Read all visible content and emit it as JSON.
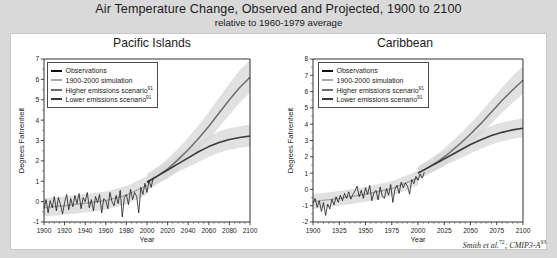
{
  "figure": {
    "title": "Air Temperature Change, Observed and Projected, 1900 to 2100",
    "subtitle": "relative to 1960-1979 average",
    "citation_text": "Smith et al.",
    "citation_sup1": "72",
    "citation_mid": "; CMIP3-A",
    "citation_sup2": "93",
    "background_color": "#d9d9d9",
    "panel_color": "#ffffff"
  },
  "legend": {
    "position": "upper-left-inside",
    "entries": [
      {
        "label": "Observations",
        "color": "#111111",
        "sup": ""
      },
      {
        "label": "1900-2000 simulation",
        "color": "#a8a8a8",
        "sup": ""
      },
      {
        "label": "Higher emissions scenario",
        "color": "#6d6d6d",
        "sup": "91"
      },
      {
        "label": "Lower emissions scenario",
        "color": "#3a3a3a",
        "sup": "91"
      }
    ]
  },
  "chart_data": [
    {
      "type": "line",
      "title": "Pacific Islands",
      "xlabel": "Year",
      "ylabel": "Degrees Fahrenheit",
      "xlim": [
        1900,
        2100
      ],
      "ylim": [
        -1,
        7
      ],
      "xticks": [
        1900,
        1920,
        1940,
        1960,
        1980,
        2000,
        2020,
        2040,
        2060,
        2080,
        2100
      ],
      "yticks": [
        -1,
        0,
        1,
        2,
        3,
        4,
        5,
        6,
        7
      ],
      "grid": false,
      "series": [
        {
          "name": "Observations",
          "color": "#111111",
          "x": [
            1900,
            1902,
            1904,
            1906,
            1908,
            1910,
            1912,
            1914,
            1916,
            1918,
            1920,
            1922,
            1924,
            1926,
            1928,
            1930,
            1932,
            1934,
            1936,
            1938,
            1940,
            1942,
            1944,
            1946,
            1948,
            1950,
            1952,
            1954,
            1956,
            1958,
            1960,
            1962,
            1964,
            1966,
            1968,
            1970,
            1972,
            1974,
            1976,
            1978,
            1980,
            1982,
            1984,
            1986,
            1988,
            1990,
            1992,
            1994,
            1996,
            1998,
            2000,
            2002,
            2004,
            2006
          ],
          "values": [
            -0.35,
            0.1,
            -0.55,
            0.05,
            -0.3,
            0.25,
            -0.45,
            0.2,
            -0.15,
            -0.6,
            -0.05,
            0.35,
            -0.4,
            0.15,
            -0.25,
            0.3,
            -0.1,
            0.4,
            -0.35,
            0.2,
            0.0,
            0.45,
            -0.3,
            0.1,
            -0.45,
            0.25,
            -0.05,
            0.35,
            -0.55,
            0.15,
            0.05,
            -0.35,
            0.45,
            0.0,
            -0.2,
            0.3,
            -0.1,
            0.55,
            -0.75,
            0.2,
            0.35,
            -0.15,
            0.6,
            0.1,
            0.45,
            0.25,
            -0.55,
            0.7,
            0.35,
            0.9,
            0.45,
            1.05,
            0.7,
            1.15
          ]
        },
        {
          "name": "1900-2000 simulation",
          "color": "#a8a8a8",
          "x": [
            1900,
            1920,
            1940,
            1960,
            1980,
            2000
          ],
          "values": [
            -0.28,
            -0.2,
            -0.08,
            0.05,
            0.32,
            0.8
          ]
        },
        {
          "name": "Higher emissions scenario",
          "color": "#6d6d6d",
          "x": [
            2000,
            2010,
            2020,
            2030,
            2040,
            2050,
            2060,
            2070,
            2080,
            2090,
            2100
          ],
          "values": [
            0.95,
            1.25,
            1.6,
            2.05,
            2.55,
            3.1,
            3.7,
            4.35,
            5.0,
            5.6,
            6.1
          ],
          "band_low": [
            0.55,
            0.85,
            1.15,
            1.55,
            2.0,
            2.5,
            3.05,
            3.65,
            4.25,
            4.85,
            5.35
          ],
          "band_high": [
            1.35,
            1.7,
            2.1,
            2.6,
            3.15,
            3.75,
            4.4,
            5.1,
            5.8,
            6.45,
            6.95
          ]
        },
        {
          "name": "Lower emissions scenario",
          "color": "#3a3a3a",
          "x": [
            2000,
            2010,
            2020,
            2030,
            2040,
            2050,
            2060,
            2070,
            2080,
            2090,
            2100
          ],
          "values": [
            0.95,
            1.25,
            1.55,
            1.85,
            2.15,
            2.45,
            2.7,
            2.9,
            3.05,
            3.15,
            3.22
          ],
          "band_low": [
            0.6,
            0.9,
            1.15,
            1.45,
            1.7,
            1.95,
            2.2,
            2.4,
            2.55,
            2.65,
            2.7
          ],
          "band_high": [
            1.3,
            1.6,
            1.95,
            2.25,
            2.6,
            2.9,
            3.2,
            3.45,
            3.6,
            3.7,
            3.78
          ]
        }
      ]
    },
    {
      "type": "line",
      "title": "Caribbean",
      "xlabel": "Year",
      "ylabel": "Degrees Fahrenheit",
      "xlim": [
        1900,
        2100
      ],
      "ylim": [
        -2,
        8
      ],
      "xticks": [
        1900,
        1925,
        1950,
        1975,
        2000,
        2025,
        2050,
        2075,
        2100
      ],
      "yticks": [
        -2,
        -1,
        0,
        1,
        2,
        3,
        4,
        5,
        6,
        7,
        8
      ],
      "grid": false,
      "series": [
        {
          "name": "Observations",
          "color": "#111111",
          "x": [
            1900,
            1902,
            1904,
            1906,
            1908,
            1910,
            1912,
            1914,
            1916,
            1918,
            1920,
            1922,
            1924,
            1926,
            1928,
            1930,
            1932,
            1934,
            1936,
            1938,
            1940,
            1942,
            1944,
            1946,
            1948,
            1950,
            1952,
            1954,
            1956,
            1958,
            1960,
            1962,
            1964,
            1966,
            1968,
            1970,
            1972,
            1974,
            1976,
            1978,
            1980,
            1982,
            1984,
            1986,
            1988,
            1990,
            1992,
            1994,
            1996,
            1998,
            2000,
            2002,
            2004,
            2006
          ],
          "values": [
            -0.85,
            -0.55,
            -1.1,
            -0.7,
            -1.35,
            -0.8,
            -1.6,
            -0.9,
            -1.2,
            -0.6,
            -0.95,
            -0.45,
            -0.8,
            -0.35,
            -0.7,
            -0.25,
            -0.55,
            -0.15,
            -0.6,
            -0.3,
            -0.1,
            0.2,
            -0.45,
            -0.05,
            -0.55,
            0.1,
            -0.3,
            0.25,
            -0.7,
            -0.2,
            -0.05,
            -0.65,
            0.15,
            -0.4,
            -0.55,
            0.05,
            -0.35,
            0.3,
            -0.8,
            0.0,
            0.25,
            -0.25,
            0.45,
            0.1,
            0.4,
            0.2,
            -0.3,
            0.6,
            0.35,
            0.8,
            0.55,
            0.95,
            0.7,
            1.05
          ]
        },
        {
          "name": "1900-2000 simulation",
          "color": "#a8a8a8",
          "x": [
            1900,
            1925,
            1950,
            1975,
            2000
          ],
          "values": [
            -0.75,
            -0.55,
            -0.3,
            0.05,
            0.7
          ]
        },
        {
          "name": "Higher emissions scenario",
          "color": "#6d6d6d",
          "x": [
            2000,
            2010,
            2020,
            2030,
            2040,
            2050,
            2060,
            2070,
            2080,
            2090,
            2100
          ],
          "values": [
            1.0,
            1.35,
            1.75,
            2.25,
            2.8,
            3.4,
            4.05,
            4.75,
            5.45,
            6.1,
            6.7
          ],
          "band_low": [
            0.6,
            0.95,
            1.3,
            1.75,
            2.25,
            2.8,
            3.4,
            4.05,
            4.7,
            5.3,
            5.85
          ],
          "band_high": [
            1.4,
            1.8,
            2.25,
            2.8,
            3.4,
            4.05,
            4.75,
            5.5,
            6.25,
            6.95,
            7.55
          ]
        },
        {
          "name": "Lower emissions scenario",
          "color": "#3a3a3a",
          "x": [
            2000,
            2010,
            2020,
            2030,
            2040,
            2050,
            2060,
            2070,
            2080,
            2090,
            2100
          ],
          "values": [
            1.0,
            1.35,
            1.7,
            2.05,
            2.4,
            2.75,
            3.05,
            3.3,
            3.5,
            3.65,
            3.75
          ],
          "band_low": [
            0.6,
            0.95,
            1.25,
            1.6,
            1.9,
            2.2,
            2.5,
            2.75,
            2.95,
            3.1,
            3.2
          ],
          "band_high": [
            1.4,
            1.75,
            2.15,
            2.5,
            2.9,
            3.25,
            3.6,
            3.9,
            4.1,
            4.25,
            4.35
          ]
        }
      ]
    }
  ]
}
